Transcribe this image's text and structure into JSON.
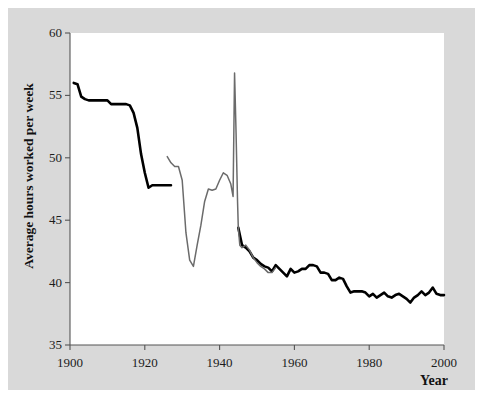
{
  "chart_data": {
    "type": "line",
    "title": "",
    "subtitle": "",
    "xlabel": "Year",
    "ylabel": "Average hours worked per week",
    "xlim": [
      1900,
      2000
    ],
    "ylim": [
      35,
      60
    ],
    "xticks": [
      1900,
      1920,
      1940,
      1960,
      1980,
      2000
    ],
    "yticks": [
      35,
      40,
      45,
      50,
      55,
      60
    ],
    "xtick_labels": [
      "1900",
      "1920",
      "1940",
      "1960",
      "1980",
      "2000"
    ],
    "ytick_labels": [
      "35",
      "40",
      "45",
      "50",
      "55",
      "60"
    ],
    "grid": false,
    "legend": "none",
    "annotations": [],
    "series": [
      {
        "name": "manufacturing-hours-black",
        "color": "#000000",
        "width": 2.6,
        "segments": [
          {
            "name": "early-segment-1901-1927",
            "points": [
              [
                1901,
                56.0
              ],
              [
                1902,
                55.9
              ],
              [
                1903,
                54.9
              ],
              [
                1904,
                54.7
              ],
              [
                1905,
                54.6
              ],
              [
                1906,
                54.6
              ],
              [
                1907,
                54.6
              ],
              [
                1908,
                54.6
              ],
              [
                1909,
                54.6
              ],
              [
                1910,
                54.6
              ],
              [
                1911,
                54.3
              ],
              [
                1912,
                54.3
              ],
              [
                1913,
                54.3
              ],
              [
                1914,
                54.3
              ],
              [
                1915,
                54.3
              ],
              [
                1916,
                54.2
              ],
              [
                1917,
                53.6
              ],
              [
                1918,
                52.4
              ],
              [
                1919,
                50.3
              ],
              [
                1920,
                48.8
              ],
              [
                1921,
                47.6
              ],
              [
                1922,
                47.8
              ],
              [
                1923,
                47.8
              ],
              [
                1924,
                47.8
              ],
              [
                1925,
                47.8
              ],
              [
                1926,
                47.8
              ],
              [
                1927,
                47.8
              ]
            ]
          },
          {
            "name": "postwar-segment-1945-2000",
            "points": [
              [
                1945,
                44.4
              ],
              [
                1946,
                43.0
              ],
              [
                1947,
                42.8
              ],
              [
                1948,
                42.5
              ],
              [
                1949,
                42.0
              ],
              [
                1950,
                41.8
              ],
              [
                1951,
                41.5
              ],
              [
                1952,
                41.3
              ],
              [
                1953,
                41.2
              ],
              [
                1954,
                40.9
              ],
              [
                1955,
                41.4
              ],
              [
                1956,
                41.1
              ],
              [
                1957,
                40.8
              ],
              [
                1958,
                40.5
              ],
              [
                1959,
                41.1
              ],
              [
                1960,
                40.8
              ],
              [
                1961,
                40.9
              ],
              [
                1962,
                41.1
              ],
              [
                1963,
                41.1
              ],
              [
                1964,
                41.4
              ],
              [
                1965,
                41.4
              ],
              [
                1966,
                41.3
              ],
              [
                1967,
                40.8
              ],
              [
                1968,
                40.8
              ],
              [
                1969,
                40.7
              ],
              [
                1970,
                40.2
              ],
              [
                1971,
                40.2
              ],
              [
                1972,
                40.4
              ],
              [
                1973,
                40.3
              ],
              [
                1974,
                39.7
              ],
              [
                1975,
                39.2
              ],
              [
                1976,
                39.3
              ],
              [
                1977,
                39.3
              ],
              [
                1978,
                39.3
              ],
              [
                1979,
                39.2
              ],
              [
                1980,
                38.9
              ],
              [
                1981,
                39.1
              ],
              [
                1982,
                38.8
              ],
              [
                1983,
                39.0
              ],
              [
                1984,
                39.2
              ],
              [
                1985,
                38.9
              ],
              [
                1986,
                38.8
              ],
              [
                1987,
                39.0
              ],
              [
                1988,
                39.1
              ],
              [
                1989,
                38.9
              ],
              [
                1990,
                38.7
              ],
              [
                1991,
                38.4
              ],
              [
                1992,
                38.8
              ],
              [
                1993,
                39.0
              ],
              [
                1994,
                39.3
              ],
              [
                1995,
                39.0
              ],
              [
                1996,
                39.2
              ],
              [
                1997,
                39.6
              ],
              [
                1998,
                39.1
              ],
              [
                1999,
                39.0
              ],
              [
                2000,
                39.0
              ]
            ]
          }
        ]
      },
      {
        "name": "manufacturing-hours-gray",
        "color": "#6b6b6b",
        "width": 1.5,
        "segments": [
          {
            "name": "gray-segment-1926-1955",
            "points": [
              [
                1926,
                50.1
              ],
              [
                1927,
                49.6
              ],
              [
                1928,
                49.3
              ],
              [
                1929,
                49.3
              ],
              [
                1930,
                48.2
              ],
              [
                1931,
                44.0
              ],
              [
                1932,
                41.8
              ],
              [
                1933,
                41.3
              ],
              [
                1934,
                43.0
              ],
              [
                1935,
                44.6
              ],
              [
                1936,
                46.5
              ],
              [
                1937,
                47.5
              ],
              [
                1938,
                47.4
              ],
              [
                1939,
                47.5
              ],
              [
                1940,
                48.2
              ],
              [
                1941,
                48.8
              ],
              [
                1942,
                48.6
              ],
              [
                1943,
                47.9
              ],
              [
                1943.6,
                46.9
              ],
              [
                1944,
                56.8
              ],
              [
                1944.4,
                52.0
              ],
              [
                1944.8,
                46.5
              ],
              [
                1945,
                44.4
              ],
              [
                1945.4,
                43.0
              ],
              [
                1946,
                42.8
              ],
              [
                1947,
                43.0
              ],
              [
                1948,
                42.6
              ],
              [
                1949,
                42.0
              ],
              [
                1950,
                41.6
              ],
              [
                1951,
                41.3
              ],
              [
                1952,
                41.1
              ],
              [
                1953,
                40.8
              ],
              [
                1954,
                40.8
              ],
              [
                1955,
                41.2
              ]
            ]
          }
        ]
      }
    ]
  },
  "axis": {
    "y_label": "Average hours worked per week",
    "x_label": "Year"
  }
}
